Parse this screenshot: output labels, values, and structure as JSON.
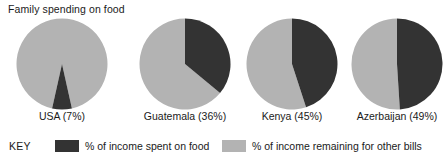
{
  "chart_data": {
    "type": "pie",
    "title": "Family spending on food",
    "xlabel": "",
    "ylabel": "",
    "legend_position": "bottom",
    "grid": false,
    "colors": {
      "spent_on_food": "#333333",
      "remaining_other_bills": "#b3b3b3",
      "background": "#ffffff",
      "text": "#1a1a1a"
    },
    "series": [
      {
        "name": "% of income spent on food",
        "values": [
          7,
          36,
          45,
          49
        ]
      },
      {
        "name": "% of income remaining for other bills",
        "values": [
          93,
          64,
          55,
          51
        ]
      }
    ],
    "categories": [
      "USA",
      "Guatemala",
      "Kenya",
      "Azerbaijan"
    ],
    "pies": [
      {
        "country": "USA",
        "percent": 7,
        "remainder": 93,
        "label": "USA (7%)"
      },
      {
        "country": "Guatemala",
        "percent": 36,
        "remainder": 64,
        "label": "Guatemala (36%)"
      },
      {
        "country": "Kenya",
        "percent": 45,
        "remainder": 55,
        "label": "Kenya (45%)"
      },
      {
        "country": "Azerbaijan",
        "percent": 49,
        "remainder": 51,
        "label": "Azerbaijan (49%)"
      }
    ]
  },
  "title": "Family spending on food",
  "legend": {
    "key_word": "KEY",
    "entries": [
      {
        "label": "% of income spent on food",
        "color": "#333333",
        "swatch": "dark-swatch"
      },
      {
        "label": "% of income remaining for other bills",
        "color": "#b3b3b3",
        "swatch": "light-swatch"
      }
    ]
  }
}
